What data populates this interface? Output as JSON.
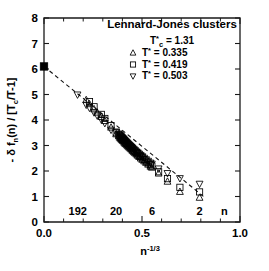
{
  "chart_data": {
    "type": "scatter",
    "title": "Lennard-Jones clusters",
    "subtitle": "T*c = 1.31",
    "xlabel": "n-1/3",
    "ylabel": "- δ fn(n) / [Tc/T-1]",
    "xlim": [
      0.0,
      1.0
    ],
    "ylim": [
      0,
      8
    ],
    "x_ticks": [
      0.0,
      0.5,
      1.0
    ],
    "x_tick_labels": [
      "0.0",
      "0.5",
      "1.0"
    ],
    "x_minor_step": 0.1,
    "y_ticks": [
      0,
      1,
      2,
      3,
      4,
      5,
      6,
      7,
      8
    ],
    "y_tick_labels": [
      "0",
      "1",
      "2",
      "3",
      "4",
      "5",
      "6",
      "7",
      "8"
    ],
    "grid": false,
    "legend_position": "top-right",
    "inner_axis_name": "n",
    "inner_axis_labels": [
      {
        "label": "192",
        "x": 0.172
      },
      {
        "label": "20",
        "x": 0.368
      },
      {
        "label": "6",
        "x": 0.551
      },
      {
        "label": "2",
        "x": 0.794
      }
    ],
    "trendline": {
      "label": "linear fit",
      "style": "dashed",
      "x": [
        0.0,
        0.825
      ],
      "y": [
        6.1,
        0.93
      ]
    },
    "series": [
      {
        "name": "T* = 0.335",
        "marker": "triangle-up",
        "points": [
          [
            0.2154,
            4.78
          ],
          [
            0.2321,
            4.62
          ],
          [
            0.2554,
            4.42
          ],
          [
            0.2714,
            4.29
          ],
          [
            0.2924,
            4.12
          ],
          [
            0.3104,
            3.96
          ],
          [
            0.342,
            3.7
          ],
          [
            0.3684,
            3.44
          ],
          [
            0.3816,
            3.36
          ],
          [
            0.3868,
            3.3
          ],
          [
            0.3914,
            3.26
          ],
          [
            0.3962,
            3.22
          ],
          [
            0.4005,
            3.19
          ],
          [
            0.4046,
            3.16
          ],
          [
            0.4094,
            3.11
          ],
          [
            0.414,
            3.07
          ],
          [
            0.419,
            3.04
          ],
          [
            0.424,
            3.0
          ],
          [
            0.429,
            2.96
          ],
          [
            0.4344,
            2.92
          ],
          [
            0.4401,
            2.88
          ],
          [
            0.4456,
            2.84
          ],
          [
            0.4514,
            2.79
          ],
          [
            0.4578,
            2.74
          ],
          [
            0.4642,
            2.7
          ],
          [
            0.471,
            2.65
          ],
          [
            0.4781,
            2.6
          ],
          [
            0.4855,
            2.55
          ],
          [
            0.4932,
            2.49
          ],
          [
            0.5013,
            2.44
          ],
          [
            0.5109,
            2.38
          ],
          [
            0.5207,
            2.32
          ],
          [
            0.5313,
            2.25
          ],
          [
            0.5429,
            2.17
          ],
          [
            0.5503,
            2.13
          ],
          [
            0.5848,
            1.9
          ],
          [
            0.63,
            1.58
          ],
          [
            0.6934,
            1.18
          ],
          [
            0.7937,
            0.95
          ]
        ]
      },
      {
        "name": "T* = 0.419",
        "marker": "square",
        "points": [
          [
            0.2321,
            4.72
          ],
          [
            0.2554,
            4.52
          ],
          [
            0.2924,
            4.22
          ],
          [
            0.3104,
            4.06
          ],
          [
            0.342,
            3.78
          ],
          [
            0.3684,
            3.5
          ],
          [
            0.3816,
            3.42
          ],
          [
            0.3868,
            3.38
          ],
          [
            0.3914,
            3.34
          ],
          [
            0.3962,
            3.3
          ],
          [
            0.4005,
            3.26
          ],
          [
            0.4046,
            3.23
          ],
          [
            0.4094,
            3.19
          ],
          [
            0.414,
            3.15
          ],
          [
            0.419,
            3.11
          ],
          [
            0.424,
            3.07
          ],
          [
            0.429,
            3.03
          ],
          [
            0.4344,
            2.99
          ],
          [
            0.4401,
            2.95
          ],
          [
            0.4456,
            2.91
          ],
          [
            0.4514,
            2.87
          ],
          [
            0.4578,
            2.82
          ],
          [
            0.4642,
            2.77
          ],
          [
            0.471,
            2.72
          ],
          [
            0.4781,
            2.68
          ],
          [
            0.4855,
            2.62
          ],
          [
            0.4932,
            2.57
          ],
          [
            0.5013,
            2.52
          ],
          [
            0.5109,
            2.45
          ],
          [
            0.5207,
            2.39
          ],
          [
            0.5313,
            2.32
          ],
          [
            0.5429,
            2.25
          ],
          [
            0.5503,
            2.2
          ],
          [
            0.5848,
            1.97
          ],
          [
            0.63,
            1.7
          ],
          [
            0.6934,
            1.36
          ],
          [
            0.7937,
            1.18
          ]
        ]
      },
      {
        "name": "T* = 0.503",
        "marker": "triangle-down",
        "points": [
          [
            0.171,
            5.0
          ],
          [
            0.2154,
            4.6
          ],
          [
            0.2321,
            4.48
          ],
          [
            0.2554,
            4.3
          ],
          [
            0.2714,
            4.18
          ],
          [
            0.2924,
            4.02
          ],
          [
            0.3104,
            3.88
          ],
          [
            0.342,
            3.62
          ],
          [
            0.3684,
            3.55
          ],
          [
            0.3816,
            3.47
          ],
          [
            0.3868,
            3.43
          ],
          [
            0.3914,
            3.39
          ],
          [
            0.3962,
            3.35
          ],
          [
            0.4005,
            3.31
          ],
          [
            0.4046,
            3.28
          ],
          [
            0.4094,
            3.24
          ],
          [
            0.414,
            3.2
          ],
          [
            0.419,
            3.16
          ],
          [
            0.424,
            3.12
          ],
          [
            0.429,
            3.08
          ],
          [
            0.4344,
            3.04
          ],
          [
            0.4401,
            3.0
          ],
          [
            0.4456,
            2.96
          ],
          [
            0.4514,
            2.92
          ],
          [
            0.4578,
            2.87
          ],
          [
            0.4642,
            2.82
          ],
          [
            0.471,
            2.77
          ],
          [
            0.4781,
            2.73
          ],
          [
            0.4855,
            2.68
          ],
          [
            0.4932,
            2.63
          ],
          [
            0.5013,
            2.58
          ],
          [
            0.5109,
            2.52
          ],
          [
            0.5207,
            2.46
          ],
          [
            0.5313,
            2.4
          ],
          [
            0.5429,
            2.33
          ],
          [
            0.5503,
            2.29
          ],
          [
            0.5848,
            2.1
          ],
          [
            0.63,
            1.92
          ],
          [
            0.6934,
            1.72
          ],
          [
            0.7937,
            1.5
          ]
        ]
      },
      {
        "name": "bulk limit",
        "marker": "filled-square",
        "points": [
          [
            0.0,
            6.1
          ]
        ]
      }
    ]
  },
  "title": {
    "text": "Lennard-Jones clusters"
  },
  "annotations": {
    "tc_prefix": "T",
    "tc_star": "*",
    "tc_sub": "c",
    "tc_value": "= 1.31"
  },
  "legend": {
    "entries": [
      {
        "marker": "triangle-up",
        "prefix": "T",
        "star": "*",
        "value": "= 0.335"
      },
      {
        "marker": "square",
        "prefix": "T",
        "star": "*",
        "value": "= 0.419"
      },
      {
        "marker": "triangle-down",
        "prefix": "T",
        "star": "*",
        "value": "= 0.503"
      }
    ]
  },
  "axes": {
    "x_title_base": "n",
    "x_title_exp": "-1/3",
    "y_title": "- δ f",
    "y_title_sub": "n",
    "y_title_rest": "(n) / [T",
    "y_title_sub2": "c",
    "y_title_tail": "/T-1]"
  }
}
